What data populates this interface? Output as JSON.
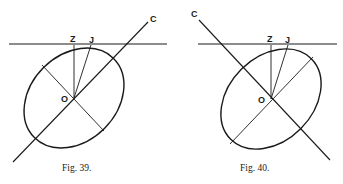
{
  "figures": [
    {
      "caption": "Fig. 39.",
      "labels": {
        "c": "C",
        "z": "Z",
        "j": "J",
        "o": "O"
      }
    },
    {
      "caption": "Fig. 40.",
      "labels": {
        "c": "C",
        "z": "Z",
        "j": "J",
        "o": "O"
      }
    }
  ],
  "colors": {
    "ink": "#1a1a1a",
    "paper": "#ffffff"
  }
}
